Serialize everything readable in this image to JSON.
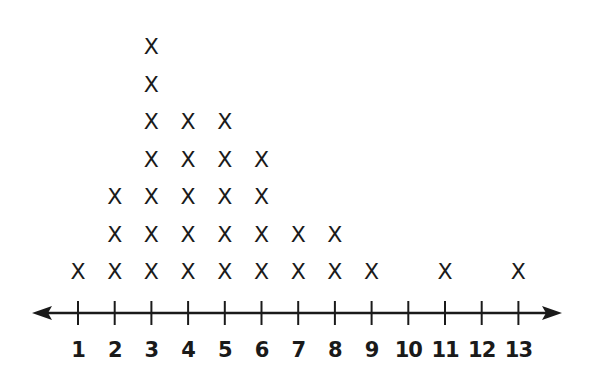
{
  "chart_data": {
    "type": "dot_plot",
    "title": "",
    "xlabel": "",
    "ylabel": "",
    "marker": "X",
    "categories": [
      1,
      2,
      3,
      4,
      5,
      6,
      7,
      8,
      9,
      10,
      11,
      12,
      13
    ],
    "values": [
      1,
      3,
      7,
      5,
      5,
      4,
      2,
      2,
      1,
      0,
      1,
      0,
      1
    ],
    "tick_labels": [
      "1",
      "2",
      "3",
      "4",
      "5",
      "6",
      "7",
      "8",
      "9",
      "10",
      "11",
      "12",
      "13"
    ],
    "xlim": [
      1,
      13
    ],
    "axis": {
      "arrows": "both",
      "grid": false
    },
    "colors": {
      "ink": "#1a1a1a",
      "background": "#ffffff"
    }
  }
}
